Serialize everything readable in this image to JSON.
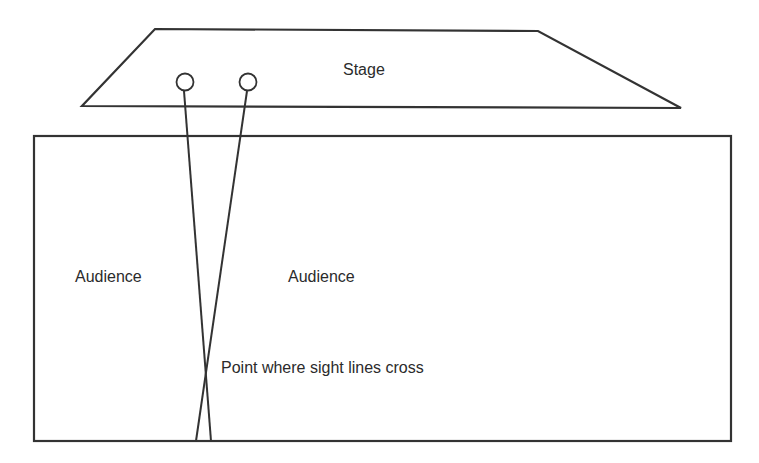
{
  "diagram": {
    "stage_label": "Stage",
    "audience_left_label": "Audience",
    "audience_right_label": "Audience",
    "crossing_label": "Point where sight lines cross",
    "colors": {
      "stroke": "#333333",
      "text": "#2b2b2b",
      "background": "#ffffff"
    }
  }
}
